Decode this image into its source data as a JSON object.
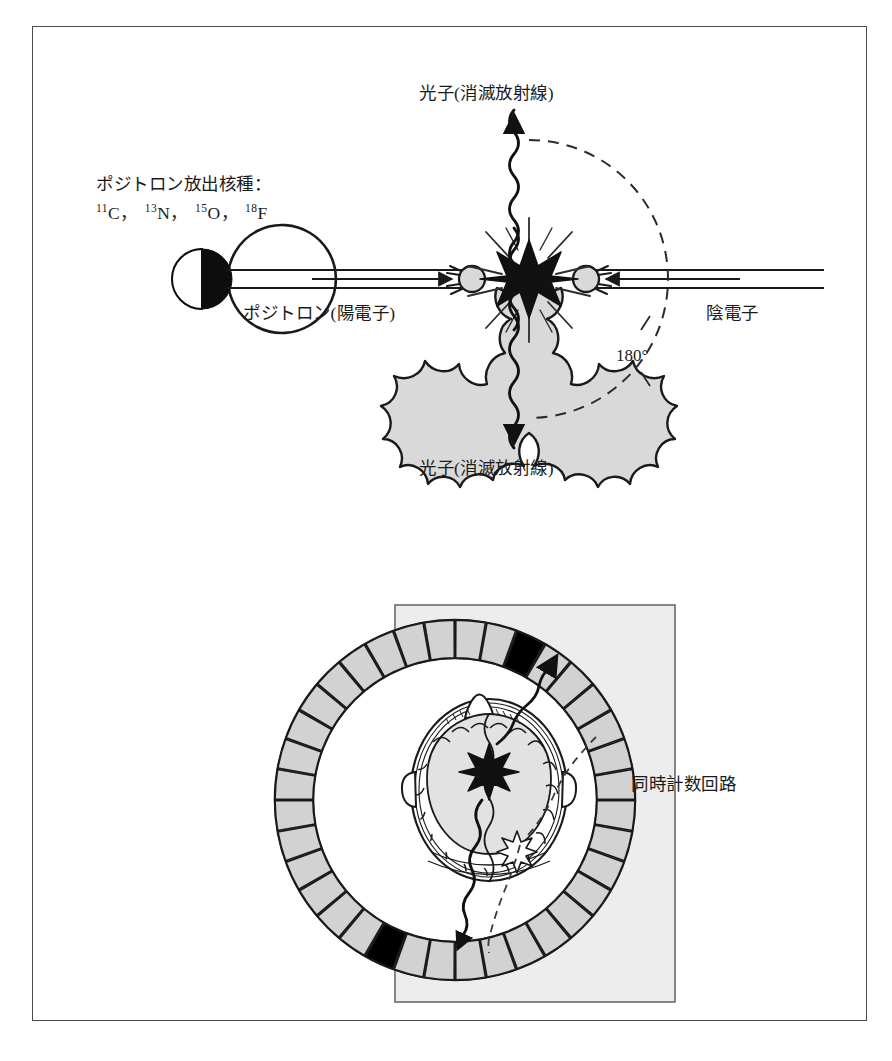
{
  "figure": {
    "title_absent": true,
    "border_color": "#4a4a4a",
    "background": "#ffffff"
  },
  "top_panel": {
    "name": "positron-annihilation-schematic",
    "source_label": {
      "line1": "ポジトロン放出核種：",
      "nuclides": [
        {
          "mass": "11",
          "symbol": "C"
        },
        {
          "mass": "13",
          "symbol": "N"
        },
        {
          "mass": "15",
          "symbol": "O"
        },
        {
          "mass": "18",
          "symbol": "F"
        }
      ],
      "separator": "，"
    },
    "photon_top_label": "光子(消滅放射線)",
    "photon_bottom_label": "光子(消滅放射線)",
    "positron_label": "ポジトロン(陽電子)",
    "electron_label": "陰電子",
    "angle_label": "180°",
    "colors": {
      "burst_fill": "#d9d9d9",
      "burst_stroke": "#1a1a1a",
      "star_fill": "#111111",
      "line": "#1a1a1a"
    }
  },
  "bottom_panel": {
    "name": "pet-detector-ring-schematic",
    "coincidence_label": "同時計数回路",
    "detector_ring": {
      "segment_count": 36,
      "segment_fill": "#d2d2d2",
      "active_segment_fill": "#000000",
      "active_segments": [
        2,
        20
      ],
      "stroke": "#1a1a1a"
    },
    "circuit_box": {
      "fill": "#ededed",
      "stroke": "#6a6a6a"
    },
    "head": {
      "skull_fill": "#ffffff",
      "brain_fill": "#e2e2e2",
      "annihilation_star_fill": "#111111",
      "secondary_star_fill": "#ffffff"
    }
  }
}
